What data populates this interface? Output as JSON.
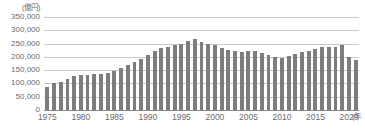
{
  "chart_data": {
    "type": "bar",
    "title": "",
    "xlabel": "年",
    "ylabel": "",
    "unit_label": "(億円)",
    "x_axis_unit": "(年",
    "ylim": [
      0,
      350000
    ],
    "ytick_labels": [
      "350,000",
      "300,000",
      "250,000",
      "200,000",
      "150,000",
      "100,000",
      "50,000",
      "0"
    ],
    "ytick_values": [
      350000,
      300000,
      250000,
      200000,
      150000,
      100000,
      50000,
      0
    ],
    "xtick_labels": [
      "1975",
      "1980",
      "1985",
      "1990",
      "1995",
      "2000",
      "2005",
      "2010",
      "2015",
      "2020"
    ],
    "xtick_values": [
      1975,
      1980,
      1985,
      1990,
      1995,
      2000,
      2005,
      2010,
      2015,
      2020
    ],
    "grid": true,
    "legend": "none",
    "bar_color": "#7d7d7d",
    "grid_color": "#c9c9c9",
    "categories": [
      "1975",
      "1976",
      "1977",
      "1978",
      "1979",
      "1980",
      "1981",
      "1982",
      "1983",
      "1984",
      "1985",
      "1986",
      "1987",
      "1988",
      "1989",
      "1990",
      "1991",
      "1992",
      "1993",
      "1994",
      "1995",
      "1996",
      "1997",
      "1998",
      "1999",
      "2000",
      "2001",
      "2002",
      "2003",
      "2004",
      "2005",
      "2006",
      "2007",
      "2008",
      "2009",
      "2010",
      "2011",
      "2012",
      "2013",
      "2014",
      "2015",
      "2016",
      "2017",
      "2018",
      "2019",
      "2020",
      "2021"
    ],
    "values": [
      87000,
      102000,
      107000,
      118000,
      128000,
      130000,
      133000,
      135000,
      135000,
      141000,
      148000,
      157000,
      169000,
      181000,
      192000,
      206000,
      222000,
      233000,
      239000,
      243000,
      250000,
      261000,
      268000,
      255000,
      250000,
      243000,
      234000,
      226000,
      222000,
      219000,
      221000,
      221000,
      214000,
      207000,
      199000,
      196000,
      202000,
      209000,
      219000,
      223000,
      230000,
      237000,
      239000,
      236000,
      246000,
      199000,
      190000
    ]
  }
}
